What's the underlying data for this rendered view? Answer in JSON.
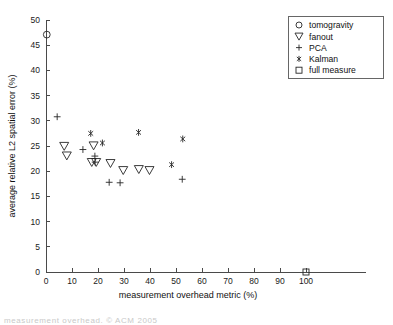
{
  "chart_data": {
    "type": "scatter",
    "title": "",
    "xlabel": "measurement overhead metric (%)",
    "ylabel": "average relative L2 spatial error (%)",
    "xlim": [
      0,
      100
    ],
    "ylim": [
      0,
      50
    ],
    "xticks": [
      0,
      10,
      20,
      30,
      40,
      50,
      60,
      70,
      80,
      90,
      100
    ],
    "yticks": [
      0,
      5,
      10,
      15,
      20,
      25,
      30,
      35,
      40,
      45,
      50
    ],
    "grid": false,
    "legend_position": "top-right",
    "series": [
      {
        "name": "tomogravity",
        "marker": "circle",
        "points": [
          [
            0.3,
            47.1
          ]
        ]
      },
      {
        "name": "fanout",
        "marker": "triangle-down",
        "points": [
          [
            7.0,
            25.0
          ],
          [
            8.0,
            23.1
          ],
          [
            18.3,
            25.1
          ],
          [
            17.6,
            21.8
          ],
          [
            19.3,
            21.8
          ],
          [
            24.8,
            21.6
          ],
          [
            29.7,
            20.2
          ],
          [
            35.7,
            20.4
          ],
          [
            39.8,
            20.2
          ]
        ]
      },
      {
        "name": "PCA",
        "marker": "plus",
        "points": [
          [
            4.3,
            30.8
          ],
          [
            14.2,
            24.3
          ],
          [
            18.8,
            23.0
          ],
          [
            18.9,
            21.8
          ],
          [
            24.3,
            17.8
          ],
          [
            28.5,
            17.7
          ],
          [
            52.4,
            18.4
          ]
        ]
      },
      {
        "name": "Kalman",
        "marker": "asterisk",
        "points": [
          [
            17.2,
            27.5
          ],
          [
            21.7,
            25.6
          ],
          [
            35.6,
            27.7
          ],
          [
            48.3,
            21.3
          ],
          [
            52.6,
            26.4
          ]
        ]
      },
      {
        "name": "full measure",
        "marker": "square",
        "points": [
          [
            100.0,
            0.0
          ]
        ]
      }
    ]
  },
  "legend": {
    "entries": [
      {
        "label": "tomogravity",
        "marker": "circle"
      },
      {
        "label": "fanout",
        "marker": "triangle-down"
      },
      {
        "label": "PCA",
        "marker": "plus"
      },
      {
        "label": "Kalman",
        "marker": "asterisk"
      },
      {
        "label": "full measure",
        "marker": "square"
      }
    ]
  },
  "footer": {
    "text": "measurement overhead. © ACM 2005"
  }
}
